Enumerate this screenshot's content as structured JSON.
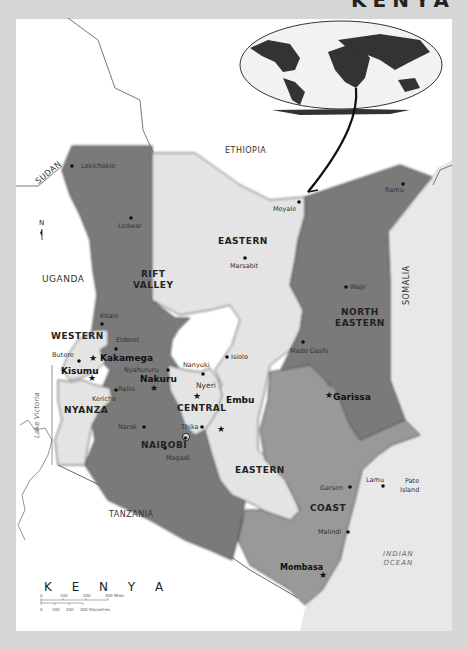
{
  "title": "KENYA",
  "colors": {
    "background": "#d6d6d6",
    "map_bg": "#ffffff",
    "dark_province": "#7a7a7a",
    "medium_province": "#999999",
    "light_province": "#e4e4e4",
    "border": "#444444"
  },
  "countries": [
    {
      "name": "SUDAN"
    },
    {
      "name": "ETHIOPIA"
    },
    {
      "name": "UGANDA"
    },
    {
      "name": "SOMALIA"
    },
    {
      "name": "TANZANIA"
    }
  ],
  "water": {
    "lake": "Lake Victoria",
    "ocean_line1": "INDIAN",
    "ocean_line2": "OCEAN"
  },
  "provinces": [
    {
      "name_line1": "RIFT",
      "name_line2": "VALLEY",
      "shade": "dark"
    },
    {
      "name_line1": "EASTERN",
      "shade": "light"
    },
    {
      "name_line1": "NORTH",
      "name_line2": "EASTERN",
      "shade": "dark"
    },
    {
      "name_line1": "WESTERN",
      "shade": "light"
    },
    {
      "name_line1": "NYANZA",
      "shade": "light"
    },
    {
      "name_line1": "CENTRAL",
      "shade": "light"
    },
    {
      "name_line1": "NAIROBI",
      "shade": "dark"
    },
    {
      "name_line1": "EASTERN",
      "shade": "light"
    },
    {
      "name_line1": "COAST",
      "shade": "medium"
    }
  ],
  "cities": [
    {
      "name": "Lokichokio",
      "type": "town"
    },
    {
      "name": "Lodwar",
      "type": "town"
    },
    {
      "name": "Moyale",
      "type": "town"
    },
    {
      "name": "Ramu",
      "type": "town"
    },
    {
      "name": "Marsabit",
      "type": "town"
    },
    {
      "name": "Wajir",
      "type": "town"
    },
    {
      "name": "Kitale",
      "type": "town"
    },
    {
      "name": "Eldoret",
      "type": "town"
    },
    {
      "name": "Butere",
      "type": "town"
    },
    {
      "name": "Kakamega",
      "type": "provincial-capital"
    },
    {
      "name": "Kisumu",
      "type": "provincial-capital"
    },
    {
      "name": "Nyahururu",
      "type": "town"
    },
    {
      "name": "Nanyuki",
      "type": "town"
    },
    {
      "name": "Isiolo",
      "type": "town"
    },
    {
      "name": "Mado Gashi",
      "type": "town"
    },
    {
      "name": "Nakuru",
      "type": "provincial-capital"
    },
    {
      "name": "Nyeri",
      "type": "provincial-capital"
    },
    {
      "name": "Embu",
      "type": "provincial-capital"
    },
    {
      "name": "Kericho",
      "type": "town"
    },
    {
      "name": "Rallis",
      "type": "town"
    },
    {
      "name": "Narok",
      "type": "town"
    },
    {
      "name": "Thika",
      "type": "town"
    },
    {
      "name": "Garissa",
      "type": "provincial-capital"
    },
    {
      "name": "Magadi",
      "type": "town"
    },
    {
      "name": "Garsen",
      "type": "town"
    },
    {
      "name": "Lamu",
      "type": "town"
    },
    {
      "name": "Pate",
      "type": "town"
    },
    {
      "name": "Island",
      "type": "town"
    },
    {
      "name": "Malindi",
      "type": "town"
    },
    {
      "name": "Mombasa",
      "type": "provincial-capital"
    }
  ],
  "compass": {
    "label": "N"
  },
  "legend": {
    "title": "K E N Y A",
    "miles_ticks": [
      "0",
      "100",
      "200",
      "300 Miles"
    ],
    "km_ticks": [
      "0",
      "100",
      "200",
      "300 Kilometres"
    ]
  }
}
